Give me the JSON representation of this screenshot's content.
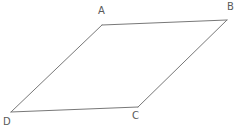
{
  "figure": {
    "name": "parallelogram-abcd",
    "background_color": "#ffffff",
    "stroke_color": "#787878",
    "label_color": "#5a5a5a",
    "stroke_width": 1,
    "width": 246,
    "height": 134,
    "vertices": [
      {
        "id": "A",
        "label": "A",
        "x": 102,
        "y": 25,
        "label_x": 98,
        "label_y": 6
      },
      {
        "id": "B",
        "label": "B",
        "x": 227,
        "y": 20,
        "label_x": 227,
        "label_y": 2
      },
      {
        "id": "C",
        "label": "C",
        "x": 138,
        "y": 107,
        "label_x": 132,
        "label_y": 111
      },
      {
        "id": "D",
        "label": "D",
        "x": 11,
        "y": 112,
        "label_x": 3,
        "label_y": 117
      }
    ],
    "edges": [
      {
        "id": "AB",
        "from": "A",
        "to": "B",
        "path": "M 102 25 L 227 20"
      },
      {
        "id": "BC",
        "from": "B",
        "to": "C",
        "path": "M 227 20 L 138 107"
      },
      {
        "id": "CD",
        "from": "C",
        "to": "D",
        "path": "M 138 107 L 11 112"
      },
      {
        "id": "DA",
        "from": "D",
        "to": "A",
        "path": "M 11 112 L 102 25"
      }
    ],
    "outline_path": "M 102 25 L 227 20 L 138 107 L 11 112 Z"
  },
  "chart_data": {
    "type": "diagram",
    "shape": "parallelogram",
    "title": "",
    "vertex_labels": [
      "A",
      "B",
      "C",
      "D"
    ],
    "points": {
      "A": [
        102,
        25
      ],
      "B": [
        227,
        20
      ],
      "C": [
        138,
        107
      ],
      "D": [
        11,
        112
      ]
    },
    "sides": [
      "AB",
      "BC",
      "CD",
      "DA"
    ],
    "xlim": [
      0,
      246
    ],
    "ylim": [
      0,
      134
    ],
    "grid": false,
    "legend": false
  }
}
